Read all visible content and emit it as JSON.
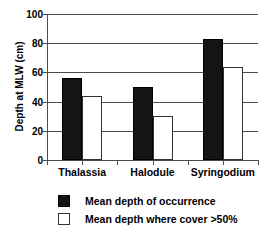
{
  "chart_data": {
    "type": "bar",
    "title": "",
    "xlabel": "",
    "ylabel": "Depth at MLW (cm)",
    "categories": [
      "Thalassia",
      "Halodule",
      "Syringodium"
    ],
    "series": [
      {
        "name": "Mean depth of occurrence",
        "color": "#141414",
        "values": [
          56,
          50,
          83
        ]
      },
      {
        "name": "Mean depth where cover >50%",
        "color": "#ffffff",
        "values": [
          44,
          30,
          64
        ]
      }
    ],
    "ylim": [
      0,
      100
    ],
    "yticks": [
      0,
      20,
      40,
      60,
      80,
      100
    ],
    "ytick_labels": [
      "0",
      "20",
      "40",
      "60",
      "80",
      "100"
    ],
    "grid": true,
    "legend_position": "bottom-left"
  },
  "legend": {
    "items": [
      {
        "label": "Mean depth of occurrence",
        "swatch": "dark"
      },
      {
        "label": "Mean depth where cover >50%",
        "swatch": "light"
      }
    ]
  }
}
